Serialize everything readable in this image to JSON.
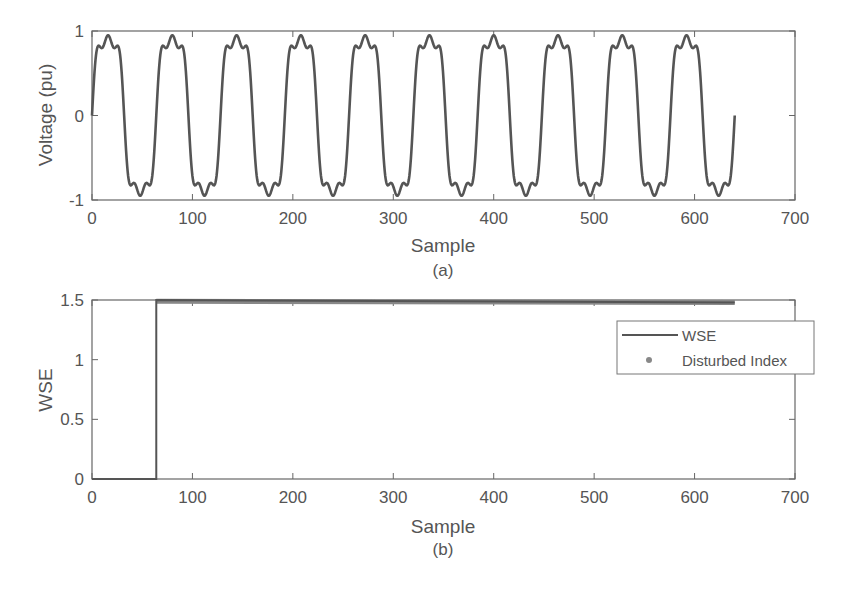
{
  "chart_data": [
    {
      "type": "line",
      "panel": "a",
      "caption": "(a)",
      "title": "",
      "xlabel": "Sample",
      "ylabel": "Voltage (pu)",
      "xlim": [
        0,
        700
      ],
      "ylim": [
        -1,
        1
      ],
      "xticks": [
        "0",
        "100",
        "200",
        "300",
        "400",
        "500",
        "600",
        "700"
      ],
      "yticks": [
        "-1",
        "0",
        "1"
      ],
      "grid": false,
      "series": [
        {
          "name": "Voltage",
          "description": "Distorted sinusoid (fundamental + 3rd/5th harmonics, clipped at ±1), ~64 samples per cycle, 10 cycles",
          "x_range": [
            0,
            640
          ],
          "period_samples": 64,
          "amplitude": 1.0,
          "end_value": 0
        }
      ]
    },
    {
      "type": "line",
      "panel": "b",
      "caption": "(b)",
      "title": "",
      "xlabel": "Sample",
      "ylabel": "WSE",
      "xlim": [
        0,
        700
      ],
      "ylim": [
        0,
        1.5
      ],
      "xticks": [
        "0",
        "100",
        "200",
        "300",
        "400",
        "500",
        "600",
        "700"
      ],
      "yticks": [
        "0",
        "0.5",
        "1",
        "1.5"
      ],
      "grid": false,
      "legend_position": "upper right",
      "series": [
        {
          "name": "WSE",
          "style": "line",
          "x": [
            0,
            64,
            64,
            640
          ],
          "values": [
            0,
            0,
            1.5,
            1.48
          ]
        },
        {
          "name": "Disturbed Index",
          "style": "markers",
          "x_range": [
            64,
            640
          ],
          "value_start": 1.49,
          "value_end": 1.48
        }
      ]
    }
  ],
  "legend": {
    "items": [
      {
        "label": "WSE"
      },
      {
        "label": "Disturbed Index"
      }
    ]
  }
}
